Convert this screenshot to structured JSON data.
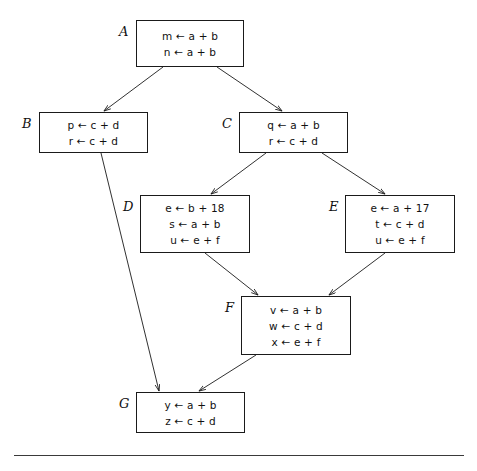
{
  "figure": {
    "type": "control-flow-graph",
    "background_color": "#ffffff",
    "border_color": "#1a1a1a",
    "text_color": "#111111"
  },
  "nodes": [
    {
      "id": "A",
      "label": "A",
      "x": 136,
      "y": 20,
      "w": 108,
      "h": 47,
      "label_x": 119,
      "label_y": 24,
      "statements": [
        "m ← a + b",
        "n ← a + b"
      ]
    },
    {
      "id": "B",
      "label": "B",
      "x": 39,
      "y": 112,
      "w": 109,
      "h": 41,
      "label_x": 22,
      "label_y": 116,
      "statements": [
        "p ← c + d",
        "r ← c + d"
      ]
    },
    {
      "id": "C",
      "label": "C",
      "x": 239,
      "y": 112,
      "w": 109,
      "h": 41,
      "label_x": 222,
      "label_y": 116,
      "statements": [
        "q ← a + b",
        "r ← c + d"
      ]
    },
    {
      "id": "D",
      "label": "D",
      "x": 140,
      "y": 195,
      "w": 110,
      "h": 58,
      "label_x": 123,
      "label_y": 199,
      "statements": [
        "e ← b + 18",
        "s ← a + b",
        "u ← e + f"
      ]
    },
    {
      "id": "E",
      "label": "E",
      "x": 345,
      "y": 195,
      "w": 110,
      "h": 58,
      "label_x": 329,
      "label_y": 199,
      "statements": [
        "e ← a + 17",
        "t ← c + d",
        "u ← e + f"
      ]
    },
    {
      "id": "F",
      "label": "F",
      "x": 241,
      "y": 296,
      "w": 110,
      "h": 59,
      "label_x": 225,
      "label_y": 300,
      "statements": [
        "v ← a + b",
        "w ← c + d",
        "x ← e + f"
      ]
    },
    {
      "id": "G",
      "label": "G",
      "x": 136,
      "y": 392,
      "w": 109,
      "h": 41,
      "label_x": 119,
      "label_y": 396,
      "statements": [
        "y ← a + b",
        "z ← c + d"
      ]
    }
  ],
  "edges": [
    {
      "from": "A",
      "to": "B",
      "x1": 163,
      "y1": 67,
      "x2": 104,
      "y2": 111
    },
    {
      "from": "A",
      "to": "C",
      "x1": 217,
      "y1": 67,
      "x2": 282,
      "y2": 111
    },
    {
      "from": "C",
      "to": "D",
      "x1": 266,
      "y1": 153,
      "x2": 211,
      "y2": 194
    },
    {
      "from": "C",
      "to": "E",
      "x1": 322,
      "y1": 153,
      "x2": 385,
      "y2": 194
    },
    {
      "from": "B",
      "to": "G",
      "x1": 101,
      "y1": 153,
      "x2": 159,
      "y2": 391
    },
    {
      "from": "D",
      "to": "F",
      "x1": 205,
      "y1": 253,
      "x2": 258,
      "y2": 295
    },
    {
      "from": "E",
      "to": "F",
      "x1": 385,
      "y1": 253,
      "x2": 329,
      "y2": 295
    },
    {
      "from": "F",
      "to": "G",
      "x1": 256,
      "y1": 355,
      "x2": 199,
      "y2": 391
    }
  ],
  "bottom_rule": {
    "present": true,
    "x": 14,
    "y": 455,
    "width": 450
  }
}
